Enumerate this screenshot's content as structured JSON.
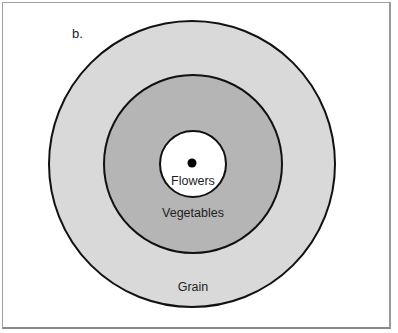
{
  "figure": {
    "panel_label": "b.",
    "rings": [
      {
        "id": "grain",
        "label": "Grain",
        "fill": "#d9d9d9",
        "radius": 144
      },
      {
        "id": "vegetables",
        "label": "Vegetables",
        "fill": "#b5b5b5",
        "radius": 90
      },
      {
        "id": "flowers",
        "label": "Flowers",
        "fill": "#ffffff",
        "radius": 33
      }
    ],
    "center_marker": {
      "fill": "#000000",
      "radius": 4.5
    },
    "stroke_color": "#111111",
    "frame_border_color": "#a0a0a0"
  }
}
